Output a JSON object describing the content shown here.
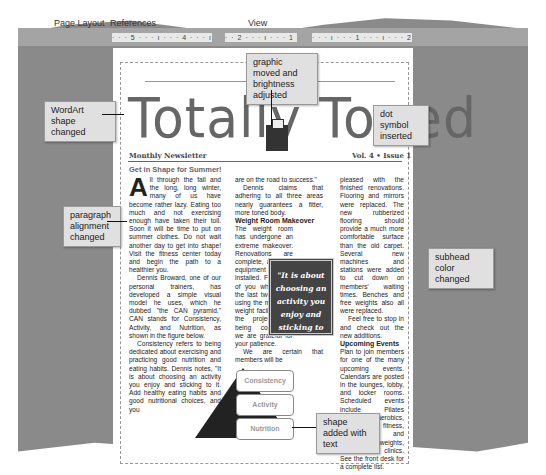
{
  "menu": {
    "items": [
      "Page Layout",
      "References",
      "View"
    ]
  },
  "ruler": {
    "left": "· · · 5 · · · ı · · · 4 · · · ı · · · 3 · ·",
    "mid": "· · 2 · · · ı · · · 1 · · · ı",
    "right": "· · · ı · · · 1 · · · ı · · · 2 · · · ı"
  },
  "document": {
    "title": "Totally Toned",
    "masthead_left": "Monthly Newsletter",
    "masthead_right": "Vol. 4 • Issue 1",
    "headline": "Get in Shape for Summer!",
    "col1": {
      "dropcap": "A",
      "p1": "ll through the fall and the long, long winter, many of us have become rather lazy. Eating too much and not exercising enough have taken their toll. Soon it will be time to put on summer clothes. Do not wait another day to get into shape! Visit the fitness center today and begin the path to a healthier you.",
      "p2": "Dennis Broward, one of our personal trainers, has developed a simple visual model he uses, which he dubbed \"the CAN pyramid.\" CAN stands for Consistency, Activity, and Nutrition, as shown in the figure below.",
      "p3": "Consistency refers to being dedicated about exercising and practicing good nutrition and eating habits. Dennis notes, \"It is about choosing an activity you enjoy and sticking to it. Add healthy eating habits and good nutritional choices, and you"
    },
    "col2": {
      "p1": "are on the road to success.\"",
      "p2": "Dennis claims that adhering to all three areas nearly guarantees a fitter, more toned body.",
      "subhead": "Weight Room Makeover",
      "p3": "The weight room has undergone an extreme makeover. Renovations are complete, and new equipment is installed. For those of you who spent the last two weeks using the makeshift weight facility while the project was being completed, we are grateful for your patience.",
      "p4": "We are certain that members will be"
    },
    "col3": {
      "p1": "pleased with the finished renovations. Flooring and mirrors were replaced. The new rubberized flooring should provide a much more comfortable surface than the old carpet. Several new machines and stations were added to cut down on members' waiting times. Benches and free weights also all were replaced.",
      "p2": "Feel free to stop in and check out the new additions.",
      "subhead": "Upcoming Events",
      "p3": "Plan to join members for one of the many upcoming events. Calendars are posted in the lounges, lobby, and locker rooms. Scheduled events include Pilates classes, aerobics, senior fitness, beginner and intermediate weights, and tennis clinics. See the front desk for a complete list."
    },
    "pull_quote": "\"It is about choosing an activity you enjoy and sticking to it.\"",
    "pyramid": [
      "Consistency",
      "Activity",
      "Nutrition"
    ]
  },
  "callouts": {
    "graphic": "graphic moved and brightness adjusted",
    "wordart": "WordArt shape changed",
    "dot": "dot symbol inserted",
    "paragraph": "paragraph alignment changed",
    "subhead": "subhead color changed",
    "shape": "shape added with text"
  }
}
